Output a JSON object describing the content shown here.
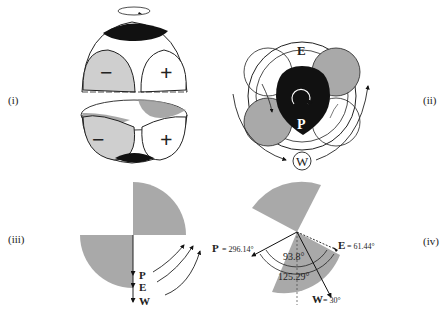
{
  "panels": {
    "i": {
      "label": "(i)",
      "signs": {
        "left": "−",
        "right": "+",
        "lower_left": "−",
        "lower_right": "+"
      }
    },
    "ii": {
      "label": "(ii)",
      "labels": {
        "top": "E",
        "center": "P",
        "bottom": "W"
      }
    },
    "iii": {
      "label": "(iii)",
      "arrows": [
        "P",
        "E",
        "W"
      ]
    },
    "iv": {
      "label": "(iv)",
      "P": {
        "name": "P",
        "eq": "= 296.14°"
      },
      "E": {
        "name": "E",
        "eq": "= 61.44°"
      },
      "W": {
        "name": "W",
        "eq": "= 30°"
      },
      "angles": {
        "inner": "93.8°",
        "outer": "125.29°"
      }
    }
  },
  "colors": {
    "gray_fill": "#a9a9a9",
    "light_gray": "#cfcfcf",
    "black": "#111111",
    "line": "#222222"
  }
}
